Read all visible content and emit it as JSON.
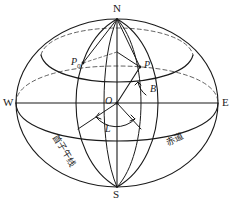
{
  "figure": {
    "stroke_color": "#1a1a1a",
    "background_color": "#ffffff",
    "cardinal_labels": {
      "north": "N",
      "south": "S",
      "east": "E",
      "west": "W"
    },
    "point_labels": {
      "center": "O",
      "point_p": "P",
      "point_p0_base": "P",
      "point_p0_subscript": "0"
    },
    "angle_labels": {
      "latitude": "B",
      "longitude": "L"
    },
    "region_labels": {
      "prime_meridian": "首子午线",
      "equator": "赤道"
    }
  }
}
